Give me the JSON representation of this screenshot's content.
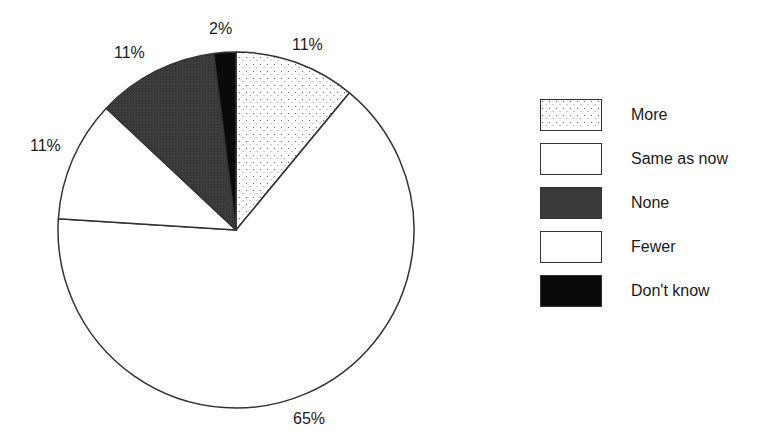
{
  "chart_data": {
    "type": "pie",
    "title": "",
    "start_angle": "12 o'clock, clockwise",
    "categories": [
      "More",
      "Same as now",
      "Fewer",
      "None",
      "Don't know"
    ],
    "values": [
      11,
      65,
      11,
      11,
      2
    ],
    "labels": [
      "11%",
      "65%",
      "11%",
      "11%",
      "2%"
    ],
    "legend": {
      "position": "right",
      "entries": [
        "More",
        "Same as now",
        "None",
        "Fewer",
        "Don't know"
      ]
    },
    "fills": {
      "More": "dotted-light",
      "Same as now": "#ffffff",
      "Fewer": "#ffffff",
      "None": "#3a3a3a",
      "Don't know": "#0a0a0a"
    }
  },
  "labels": {
    "more": "11%",
    "same": "65%",
    "fewer": "11%",
    "none": "11%",
    "dontknow": "2%"
  },
  "legend": {
    "items": [
      {
        "label": "More"
      },
      {
        "label": "Same as now"
      },
      {
        "label": "None"
      },
      {
        "label": "Fewer"
      },
      {
        "label": "Don't know"
      }
    ]
  }
}
